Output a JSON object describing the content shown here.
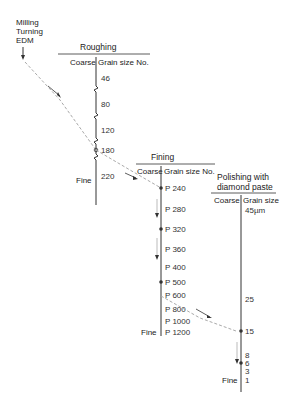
{
  "source": {
    "lines": [
      "Milling",
      "Turning",
      "EDM"
    ]
  },
  "roughing": {
    "title": "Roughing",
    "coarse_label": "Coarse",
    "grain_label": "Grain size No.",
    "fine_label": "Fine",
    "values": [
      "46",
      "80",
      "120",
      "180",
      "220"
    ]
  },
  "fining": {
    "title": "Fining",
    "coarse_label": "Coarse",
    "grain_label": "Grain size No.",
    "fine_label": "Fine",
    "values": [
      "P 240",
      "P 280",
      "P 320",
      "P 360",
      "P 400",
      "P 500",
      "P 600",
      "P 800",
      "P 1000",
      "P 1200"
    ]
  },
  "polishing": {
    "title_line1": "Polishing with",
    "title_line2": "diamond paste",
    "coarse_label": "Coarse",
    "grain_label": "Grain size",
    "fine_label": "Fine",
    "values": [
      "45µm",
      "25",
      "15",
      "8",
      "6",
      "3",
      "1"
    ]
  },
  "colors": {
    "line": "#333333",
    "dashed": "#aaaaaa",
    "text": "#222222"
  }
}
